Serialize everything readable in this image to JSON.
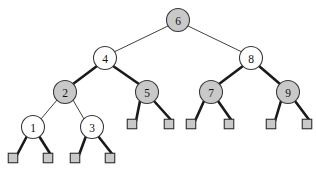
{
  "figure": {
    "kind": "red-black-tree-diagram",
    "width": 316,
    "height": 174,
    "background": "#ffffff"
  },
  "colors": {
    "black_node_fill": "#c9c9c9",
    "red_node_fill": "#ffffff",
    "node_stroke": "#3a3a3a",
    "leaf_fill": "#c9c9c9",
    "leaf_stroke": "#2e2e2e",
    "thin_edge": "#2b2b2b",
    "thick_edge": "#1a1a1a",
    "label_color": "#121212"
  },
  "legend": {
    "black_node_meaning": "black",
    "red_node_meaning": "red",
    "leaf_meaning": "nil"
  },
  "nodes": [
    {
      "id": "n6",
      "label": "6",
      "x": 178,
      "y": 20,
      "r": 11.5,
      "fill": "#c9c9c9",
      "color_role": "black"
    },
    {
      "id": "n4",
      "label": "4",
      "x": 105,
      "y": 58,
      "r": 11.5,
      "fill": "#ffffff",
      "color_role": "red"
    },
    {
      "id": "n8",
      "label": "8",
      "x": 251,
      "y": 58,
      "r": 11.5,
      "fill": "#ffffff",
      "color_role": "red"
    },
    {
      "id": "n2",
      "label": "2",
      "x": 65,
      "y": 92,
      "r": 11.5,
      "fill": "#c9c9c9",
      "color_role": "black"
    },
    {
      "id": "n5",
      "label": "5",
      "x": 147,
      "y": 92,
      "r": 11.5,
      "fill": "#c9c9c9",
      "color_role": "black"
    },
    {
      "id": "n7",
      "label": "7",
      "x": 211,
      "y": 92,
      "r": 11.5,
      "fill": "#c9c9c9",
      "color_role": "black"
    },
    {
      "id": "n9",
      "label": "9",
      "x": 288,
      "y": 92,
      "r": 11.5,
      "fill": "#c9c9c9",
      "color_role": "black"
    },
    {
      "id": "n1",
      "label": "1",
      "x": 33,
      "y": 127,
      "r": 11.5,
      "fill": "#ffffff",
      "color_role": "red"
    },
    {
      "id": "n3",
      "label": "3",
      "x": 92,
      "y": 127,
      "r": 11.5,
      "fill": "#ffffff",
      "color_role": "red"
    }
  ],
  "leaves": [
    {
      "id": "l1",
      "x": 13,
      "y": 158,
      "size": 9.5
    },
    {
      "id": "l2",
      "x": 48,
      "y": 158,
      "size": 9.5
    },
    {
      "id": "l3",
      "x": 75,
      "y": 158,
      "size": 9.5
    },
    {
      "id": "l4",
      "x": 110,
      "y": 158,
      "size": 9.5
    },
    {
      "id": "l5",
      "x": 132,
      "y": 124,
      "size": 9.5
    },
    {
      "id": "l6",
      "x": 169,
      "y": 124,
      "size": 9.5
    },
    {
      "id": "l7",
      "x": 191,
      "y": 124,
      "size": 9.5
    },
    {
      "id": "l8",
      "x": 229,
      "y": 124,
      "size": 9.5
    },
    {
      "id": "l9",
      "x": 271,
      "y": 124,
      "size": 9.5
    },
    {
      "id": "l10",
      "x": 307,
      "y": 124,
      "size": 9.5
    }
  ],
  "edges": [
    {
      "id": "e6-4",
      "from": "n6",
      "to": "n4",
      "x1": 168,
      "y1": 26,
      "x2": 114,
      "y2": 52,
      "weight": "thin"
    },
    {
      "id": "e6-8",
      "from": "n6",
      "to": "n8",
      "x1": 188,
      "y1": 26,
      "x2": 242,
      "y2": 52,
      "weight": "thin"
    },
    {
      "id": "e4-2",
      "from": "n4",
      "to": "n2",
      "x1": 97,
      "y1": 66,
      "x2": 73,
      "y2": 84,
      "weight": "thick"
    },
    {
      "id": "e4-5",
      "from": "n4",
      "to": "n5",
      "x1": 113,
      "y1": 66,
      "x2": 139,
      "y2": 84,
      "weight": "thick"
    },
    {
      "id": "e8-7",
      "from": "n8",
      "to": "n7",
      "x1": 243,
      "y1": 66,
      "x2": 219,
      "y2": 84,
      "weight": "thick"
    },
    {
      "id": "e8-9",
      "from": "n8",
      "to": "n9",
      "x1": 259,
      "y1": 66,
      "x2": 280,
      "y2": 84,
      "weight": "thick"
    },
    {
      "id": "e2-1",
      "from": "n2",
      "to": "n1",
      "x1": 57,
      "y1": 100,
      "x2": 41,
      "y2": 119,
      "weight": "thin"
    },
    {
      "id": "e2-3",
      "from": "n2",
      "to": "n3",
      "x1": 73,
      "y1": 100,
      "x2": 84,
      "y2": 119,
      "weight": "thin"
    },
    {
      "id": "e1-l1",
      "from": "n1",
      "to": "l1",
      "x1": 27,
      "y1": 136,
      "x2": 17,
      "y2": 155,
      "weight": "thick"
    },
    {
      "id": "e1-l2",
      "from": "n1",
      "to": "l2",
      "x1": 39,
      "y1": 136,
      "x2": 51,
      "y2": 155,
      "weight": "thick"
    },
    {
      "id": "e3-l3",
      "from": "n3",
      "to": "l3",
      "x1": 86,
      "y1": 136,
      "x2": 79,
      "y2": 155,
      "weight": "thick"
    },
    {
      "id": "e3-l4",
      "from": "n3",
      "to": "l4",
      "x1": 98,
      "y1": 136,
      "x2": 113,
      "y2": 155,
      "weight": "thick"
    },
    {
      "id": "e5-l5",
      "from": "n5",
      "to": "l5",
      "x1": 140,
      "y1": 101,
      "x2": 136,
      "y2": 121,
      "weight": "thick"
    },
    {
      "id": "e5-l6",
      "from": "n5",
      "to": "l6",
      "x1": 154,
      "y1": 101,
      "x2": 172,
      "y2": 121,
      "weight": "thick"
    },
    {
      "id": "e7-l7",
      "from": "n7",
      "to": "l7",
      "x1": 204,
      "y1": 101,
      "x2": 195,
      "y2": 121,
      "weight": "thick"
    },
    {
      "id": "e7-l8",
      "from": "n7",
      "to": "l8",
      "x1": 218,
      "y1": 101,
      "x2": 232,
      "y2": 121,
      "weight": "thick"
    },
    {
      "id": "e9-l9",
      "from": "n9",
      "to": "l9",
      "x1": 281,
      "y1": 101,
      "x2": 275,
      "y2": 121,
      "weight": "thick"
    },
    {
      "id": "e9-l10",
      "from": "n9",
      "to": "l10",
      "x1": 295,
      "y1": 101,
      "x2": 310,
      "y2": 121,
      "weight": "thick"
    }
  ],
  "chart_data": {
    "type": "diagram",
    "title": "",
    "structure": "binary search tree / red-black tree",
    "keys": [
      6,
      4,
      8,
      2,
      5,
      7,
      9,
      1,
      3
    ],
    "root": 6,
    "black_nodes": [
      6,
      2,
      5,
      7,
      9
    ],
    "red_nodes": [
      4,
      8,
      1,
      3
    ],
    "nil_leaf_count": 10,
    "adjacency": [
      {
        "parent": 6,
        "left": 4,
        "right": 8
      },
      {
        "parent": 4,
        "left": 2,
        "right": 5
      },
      {
        "parent": 8,
        "left": 7,
        "right": 9
      },
      {
        "parent": 2,
        "left": 1,
        "right": 3
      },
      {
        "parent": 5,
        "left": "nil",
        "right": "nil"
      },
      {
        "parent": 7,
        "left": "nil",
        "right": "nil"
      },
      {
        "parent": 9,
        "left": "nil",
        "right": "nil"
      },
      {
        "parent": 1,
        "left": "nil",
        "right": "nil"
      },
      {
        "parent": 3,
        "left": "nil",
        "right": "nil"
      }
    ]
  }
}
